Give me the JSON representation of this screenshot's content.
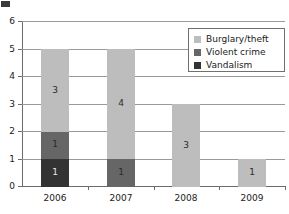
{
  "chart_data": {
    "type": "bar",
    "stacked": true,
    "title": "",
    "xlabel": "",
    "ylabel": "",
    "categories": [
      "2006",
      "2007",
      "2008",
      "2009"
    ],
    "ylim": [
      0,
      6
    ],
    "yticks": [
      0,
      1,
      2,
      3,
      4,
      5,
      6
    ],
    "ytick_labels": [
      "0",
      "1",
      "2",
      "3",
      "4",
      "5",
      "6"
    ],
    "grid": true,
    "grid_axis": "y",
    "legend_position": "top-right",
    "series": [
      {
        "name": "Vandalism",
        "color": "#333333",
        "values": [
          1,
          0,
          0,
          0
        ],
        "labels": [
          "1",
          "",
          "",
          ""
        ]
      },
      {
        "name": "Violent crime",
        "color": "#666666",
        "values": [
          1,
          1,
          0,
          0
        ],
        "labels": [
          "1",
          "1",
          "",
          ""
        ]
      },
      {
        "name": "Burglary/theft",
        "color": "#bdbdbd",
        "values": [
          3,
          4,
          3,
          1
        ],
        "labels": [
          "3",
          "4",
          "3",
          "1"
        ]
      }
    ],
    "totals": [
      5,
      5,
      3,
      1
    ],
    "legend_entries": [
      "Burglary/theft",
      "Violent crime",
      "Vandalism"
    ]
  },
  "colors": {
    "axis": "#6b6b6b",
    "grid": "#9a9a9a",
    "background": "#ffffff",
    "text": "#1a1a1a"
  }
}
